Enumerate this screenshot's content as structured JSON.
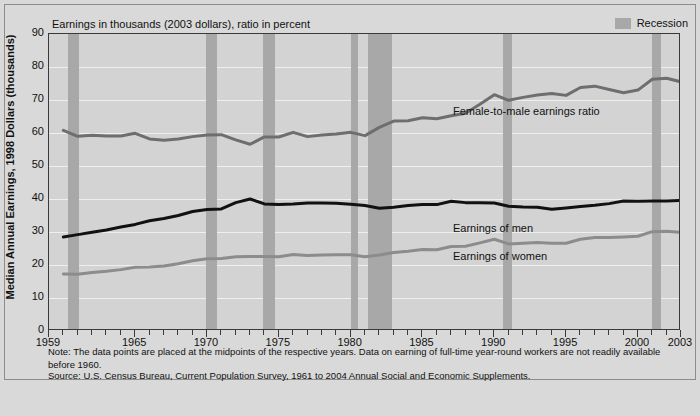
{
  "figure": {
    "subtitle": "Earnings in thousands (2003 dollars), ratio in percent",
    "y_axis_title": "Median Annual Earnings, 1998 Dollars (thousands)",
    "legend": {
      "recession_label": "Recession",
      "recession_color": "#a8a8a8"
    },
    "series_labels": {
      "ratio": "Female-to-male earnings ratio",
      "men": "Earnings of men",
      "women": "Earnings of women"
    },
    "notes": {
      "data_note": "Note: The data points are placed at the midpoints of the respective years. Data on earning of full-time year-round workers are not readily available before 1960.",
      "source": "Source: U.S. Census Bureau, Current Population Survey, 1961 to 2004 Annual Social and Economic Supplements."
    },
    "colors": {
      "men_line": "#111111",
      "women_line": "#8c8c8c",
      "ratio_line": "#6e6e6e",
      "recession_band": "#a8a8a8",
      "plot_background": "#d3d3d3",
      "page_background": "#d9d9d9",
      "gridline": "#eef0ee"
    }
  },
  "chart_data": {
    "type": "line",
    "title": "",
    "subtitle": "Earnings in thousands (2003 dollars), ratio in percent",
    "xlabel": "",
    "ylabel": "Median Annual Earnings, 1998 Dollars (thousands)",
    "ylim": [
      0,
      90
    ],
    "ytick_values": [
      0,
      10,
      20,
      30,
      40,
      50,
      60,
      70,
      80,
      90
    ],
    "xlim": [
      1959,
      2003
    ],
    "xtick_labels": [
      "1959",
      "1965",
      "1970",
      "1975",
      "1980",
      "1985",
      "1990",
      "1995",
      "2000",
      "2003"
    ],
    "xtick_label_values": [
      1959,
      1965,
      1970,
      1975,
      1980,
      1985,
      1990,
      1995,
      2000,
      2003
    ],
    "minor_ticks": "every year from 1959 to 2003",
    "grid": "horizontal gridlines at each 10 units",
    "legend_position": "top-right",
    "x": [
      1960,
      1961,
      1962,
      1963,
      1964,
      1965,
      1966,
      1967,
      1968,
      1969,
      1970,
      1971,
      1972,
      1973,
      1974,
      1975,
      1976,
      1977,
      1978,
      1979,
      1980,
      1981,
      1982,
      1983,
      1984,
      1985,
      1986,
      1987,
      1988,
      1989,
      1990,
      1991,
      1992,
      1993,
      1994,
      1995,
      1996,
      1997,
      1998,
      1999,
      2000,
      2001,
      2002,
      2003
    ],
    "series": [
      {
        "name": "Female-to-male earnings ratio",
        "units": "percent",
        "color": "#6e6e6e",
        "values": [
          60.8,
          59.0,
          59.3,
          59.1,
          59.1,
          59.9,
          58.2,
          57.8,
          58.2,
          58.9,
          59.4,
          59.5,
          57.9,
          56.6,
          58.8,
          58.8,
          60.2,
          58.9,
          59.4,
          59.7,
          60.2,
          59.2,
          61.7,
          63.6,
          63.7,
          64.6,
          64.3,
          65.2,
          66.0,
          68.7,
          71.6,
          69.9,
          70.8,
          71.5,
          72.0,
          71.4,
          73.8,
          74.2,
          73.2,
          72.2,
          73.0,
          76.3,
          76.6,
          75.5
        ]
      },
      {
        "name": "Earnings of men",
        "units": "thousands of 2003 dollars",
        "color": "#111111",
        "values": [
          28.5,
          29.2,
          29.9,
          30.6,
          31.5,
          32.3,
          33.4,
          34.1,
          35.0,
          36.2,
          36.8,
          37.0,
          38.9,
          40.0,
          38.5,
          38.3,
          38.5,
          38.8,
          38.8,
          38.7,
          38.4,
          38.0,
          37.2,
          37.5,
          38.0,
          38.3,
          38.3,
          39.3,
          38.9,
          38.9,
          38.8,
          37.8,
          37.6,
          37.5,
          36.9,
          37.3,
          37.7,
          38.1,
          38.6,
          39.4,
          39.3,
          39.4,
          39.4,
          39.6
        ]
      },
      {
        "name": "Earnings of women",
        "units": "thousands of 2003 dollars",
        "color": "#8c8c8c",
        "values": [
          17.3,
          17.2,
          17.7,
          18.1,
          18.6,
          19.3,
          19.4,
          19.7,
          20.4,
          21.3,
          21.9,
          22.0,
          22.5,
          22.6,
          22.6,
          22.5,
          23.2,
          22.9,
          23.0,
          23.1,
          23.1,
          22.5,
          23.0,
          23.8,
          24.2,
          24.7,
          24.6,
          25.6,
          25.7,
          26.7,
          27.8,
          26.4,
          26.6,
          26.8,
          26.6,
          26.6,
          27.8,
          28.3,
          28.3,
          28.5,
          28.7,
          30.1,
          30.2,
          29.9
        ]
      }
    ],
    "recession_bands": [
      {
        "label": "1960-61",
        "start": 1960.3,
        "end": 1961.1
      },
      {
        "label": "1970",
        "start": 1969.9,
        "end": 1970.7
      },
      {
        "label": "1973-75",
        "start": 1973.9,
        "end": 1974.7
      },
      {
        "label": "1980",
        "start": 1980.0,
        "end": 1980.5
      },
      {
        "label": "1981-82",
        "start": 1981.2,
        "end": 1982.9
      },
      {
        "label": "1990-91",
        "start": 1990.6,
        "end": 1991.2
      },
      {
        "label": "2001",
        "start": 2001.0,
        "end": 2001.6
      }
    ],
    "series_label_positions": {
      "ratio": {
        "x": 1992.0,
        "y": 66.5
      },
      "men": {
        "x": 1992.0,
        "y": 31.0
      },
      "women": {
        "x": 1992.0,
        "y": 22.5
      }
    }
  }
}
